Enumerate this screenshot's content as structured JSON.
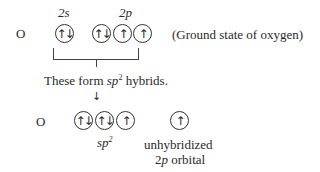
{
  "top_row": {
    "atom": "O",
    "label_2s": "2s",
    "label_2p": "2p",
    "orbitals": [
      {
        "electrons": "↑↓"
      },
      {
        "electrons": "↑↓"
      },
      {
        "electrons": "↑"
      },
      {
        "electrons": "↑"
      }
    ],
    "caption": "(Ground state of oxygen)"
  },
  "bracket_label": {
    "prefix": "These form ",
    "sp": "sp",
    "sup": "2",
    "suffix": " hybrids."
  },
  "arrow": "↓",
  "bottom_row": {
    "atom": "O",
    "hybrid_orbitals": [
      {
        "electrons": "↑↓"
      },
      {
        "electrons": "↑↓"
      },
      {
        "electrons": "↑"
      }
    ],
    "unhybridized_orbital": {
      "electrons": "↑"
    },
    "hybrid_label_sp": "sp",
    "hybrid_label_sup": "2",
    "unhybridized_label_line1": "unhybridized",
    "unhybridized_label_line2_prefix": "2",
    "unhybridized_label_line2_p": "p",
    "unhybridized_label_line2_suffix": " orbital"
  }
}
